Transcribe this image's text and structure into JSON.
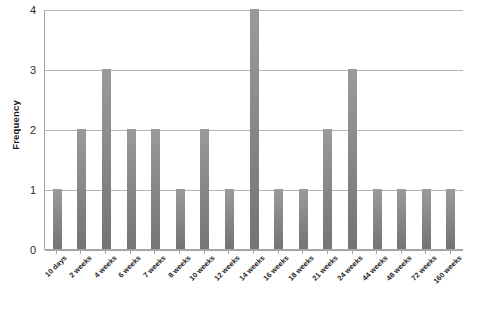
{
  "chart_data": {
    "type": "bar",
    "title": "",
    "subtitle": "",
    "xlabel": "",
    "ylabel": "Frequency",
    "categories": [
      "10 days",
      "2 weeks",
      "4 weeks",
      "6 weeks",
      "7 weeks",
      "8 weeks",
      "10 weeks",
      "12 weeks",
      "14 weeks",
      "16 weeks",
      "18 weeks",
      "21 weeks",
      "24 weeks",
      "44 weeks",
      "48 weeks",
      "72 weeks",
      "160 weeks"
    ],
    "values": [
      1,
      2,
      3,
      2,
      2,
      1,
      2,
      1,
      4,
      1,
      1,
      2,
      3,
      1,
      1,
      1,
      1
    ],
    "ylim": [
      0,
      4
    ],
    "yticks": [
      "0",
      "1",
      "2",
      "3",
      "4"
    ],
    "ytick_values": [
      0,
      1,
      2,
      3,
      4
    ],
    "grid": "horizontal",
    "legend": "none",
    "bar_color": "#8d8d8d",
    "gridline_color": "#b5b5b5",
    "axis_color": "#a6a6a6",
    "text_color": "#1f1f1f"
  }
}
